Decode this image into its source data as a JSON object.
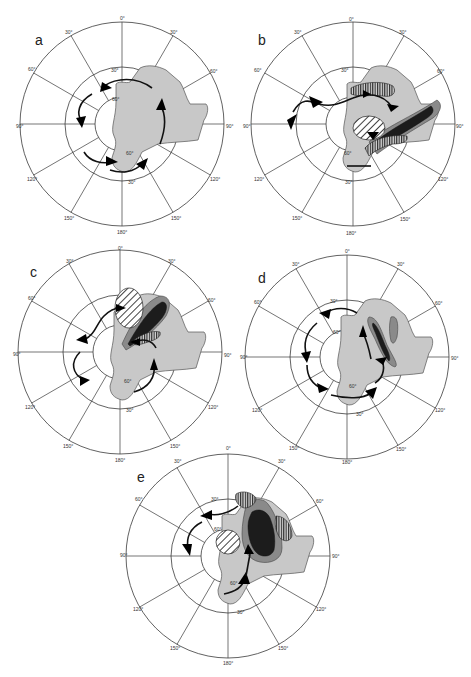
{
  "figure": {
    "panels": [
      {
        "id": "a",
        "label": "a"
      },
      {
        "id": "b",
        "label": "b"
      },
      {
        "id": "c",
        "label": "c"
      },
      {
        "id": "d",
        "label": "d"
      },
      {
        "id": "e",
        "label": "e"
      }
    ],
    "longitude_labels": {
      "top": "0°",
      "upper_left": "30°",
      "upper_right": "30°",
      "left_upper": "60°",
      "right_upper": "60°",
      "left": "90°",
      "right": "90°",
      "left_lower": "120°",
      "right_lower": "120°",
      "bottom_left": "150°",
      "bottom_right": "150°",
      "bottom": "180°"
    },
    "latitude_labels": {
      "middle_ring_top": "30°",
      "middle_ring_bottom": "30°",
      "inner_ring_top": "60°",
      "inner_ring_bottom": "60°"
    },
    "legend_colors": {
      "land": "#c8c8c8",
      "moderate_anomaly": "#8a8a8a",
      "strong_anomaly": "#1c1c1c",
      "grid": "#3a3a3a"
    }
  }
}
